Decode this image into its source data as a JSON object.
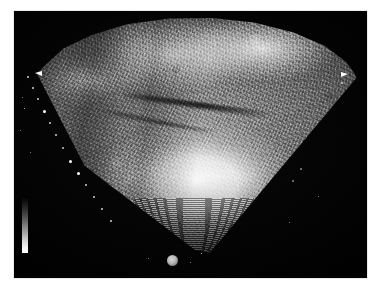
{
  "page": {
    "background_color": "#ffffff",
    "width": 380,
    "height": 290
  },
  "header": {
    "residual_text": "· ·   · · ·     · ·  · ·"
  },
  "scan_frame": {
    "background_color": "#000000",
    "left": 14,
    "top": 11,
    "width": 353,
    "height": 267
  },
  "image": {
    "modality": "ultrasound",
    "view": "sector-scan",
    "apex_position": {
      "x": 195,
      "y": 250
    },
    "sector_angle_degrees": 90,
    "tissue_colors": {
      "bright": "#ffffff",
      "mid": "#8a8a8a",
      "dark": "#1a1a1a",
      "background": "#000000"
    }
  },
  "grayscale_bar": {
    "name": "grayscale-reference-bar",
    "top_color": "#050505",
    "bottom_color": "#ffffff",
    "orientation": "vertical"
  },
  "markers": {
    "probe_marker": {
      "name": "round-orientation-marker",
      "color": "#b4b4b4"
    },
    "edge_marker_left": {
      "name": "left-sector-caliper",
      "color": "#ffffff"
    },
    "edge_marker_right": {
      "name": "right-sector-caliper",
      "color": "#ffffff"
    },
    "depth_tick_color": "#cfcfcf",
    "depth_tick_count_left": 11,
    "depth_tick_count_right": 3
  },
  "depth_ticks_left": [
    {
      "x": 27,
      "y": 76,
      "size": "small"
    },
    {
      "x": 32,
      "y": 87,
      "size": "small"
    },
    {
      "x": 37,
      "y": 98,
      "size": "small"
    },
    {
      "x": 43,
      "y": 110,
      "size": "major"
    },
    {
      "x": 49,
      "y": 122,
      "size": "small"
    },
    {
      "x": 55,
      "y": 134,
      "size": "small"
    },
    {
      "x": 62,
      "y": 147,
      "size": "small"
    },
    {
      "x": 69,
      "y": 160,
      "size": "major"
    },
    {
      "x": 77,
      "y": 172,
      "size": "major"
    },
    {
      "x": 85,
      "y": 184,
      "size": "small"
    },
    {
      "x": 93,
      "y": 196,
      "size": "small"
    },
    {
      "x": 101,
      "y": 208,
      "size": "small"
    },
    {
      "x": 110,
      "y": 220,
      "size": "small"
    }
  ],
  "depth_ticks_right": [
    {
      "x": 341,
      "y": 82,
      "size": "small"
    },
    {
      "x": 300,
      "y": 168,
      "size": "dim"
    },
    {
      "x": 292,
      "y": 180,
      "size": "dim"
    }
  ],
  "specks": [
    {
      "x": 22,
      "y": 97
    },
    {
      "x": 24,
      "y": 108,
      "bright": true
    },
    {
      "x": 20,
      "y": 130
    },
    {
      "x": 30,
      "y": 152
    },
    {
      "x": 148,
      "y": 258
    },
    {
      "x": 190,
      "y": 262
    },
    {
      "x": 201,
      "y": 253,
      "bright": true
    },
    {
      "x": 289,
      "y": 222
    },
    {
      "x": 318,
      "y": 196
    }
  ]
}
